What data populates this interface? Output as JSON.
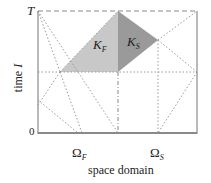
{
  "figure": {
    "axes": {
      "y_label": "time I",
      "y_label_word": "time",
      "y_label_symbol": "I",
      "x_label": "space domain",
      "y_ticks": {
        "top": "T",
        "bottom": "0"
      }
    },
    "subdomains": [
      {
        "symbol": "Ω",
        "subscript": "F",
        "label": "Ω_F"
      },
      {
        "symbol": "Ω",
        "subscript": "S",
        "label": "Ω_S"
      }
    ],
    "elements": [
      {
        "symbol": "K",
        "subscript": "F",
        "label": "K_F",
        "fill": "#c8c8c8"
      },
      {
        "symbol": "K",
        "subscript": "S",
        "label": "K_S",
        "fill": "#9a9a9a"
      }
    ],
    "colors": {
      "frame": "#8a8a8a",
      "dotted": "#9a9a9a",
      "kf_fill": "#c8c8c8",
      "ks_fill": "#9a9a9a",
      "text": "#222222"
    }
  }
}
